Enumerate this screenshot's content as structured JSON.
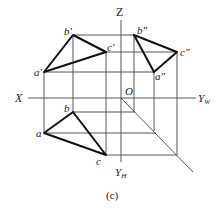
{
  "figure": {
    "caption": "(c)",
    "axes": {
      "x_label": "X",
      "z_label": "Z",
      "yw_label": "Y",
      "yw_sub": "W",
      "yh_label": "Y",
      "yh_sub": "H",
      "origin_label": "O"
    },
    "points": {
      "front": {
        "a": "a'",
        "b": "b'",
        "c": "c'"
      },
      "side": {
        "a": "a\"",
        "b": "b\"",
        "c": "c\""
      },
      "top": {
        "a": "a",
        "b": "b",
        "c": "c"
      }
    },
    "colors": {
      "line": "#111111",
      "thin_line": "#444444",
      "background": "#ffffff"
    }
  }
}
